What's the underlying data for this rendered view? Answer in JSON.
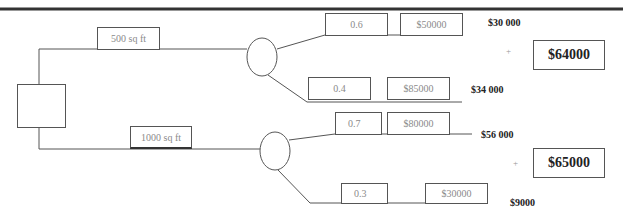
{
  "diagram": {
    "type": "decision-tree",
    "decision_node": {
      "shape": "square"
    },
    "branches": [
      {
        "label": "500 sq ft",
        "chance_node": {
          "shape": "circle"
        },
        "outcomes": [
          {
            "probability": "0.6",
            "payoff": "$50000",
            "expected_value": "$30 000"
          },
          {
            "probability": "0.4",
            "payoff": "$85000",
            "expected_value": "$34 000"
          }
        ],
        "plus_sign": "+",
        "total": "$64000"
      },
      {
        "label": "1000 sq ft",
        "chance_node": {
          "shape": "circle"
        },
        "outcomes": [
          {
            "probability": "0.7",
            "payoff": "$80000",
            "expected_value": "$56 000"
          },
          {
            "probability": "0.3",
            "payoff": "$30000",
            "expected_value": "$9000"
          }
        ],
        "plus_sign": "+",
        "total": "$65000"
      }
    ]
  },
  "colors": {
    "line": "#555555",
    "top_rule": "#333333",
    "box_text": "#8a8a8a",
    "label_text": "#222222"
  }
}
